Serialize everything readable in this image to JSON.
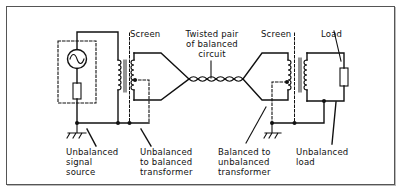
{
  "diagram": {
    "labels": {
      "screen_left": "Screen",
      "screen_right": "Screen",
      "twisted_pair": "Twisted pair\nof balanced\ncircuit",
      "load": "Load",
      "unbalanced_source": "Unbalanced\nsignal\nsource",
      "unbal_to_bal": "Unbalanced\nto balanced\ntransformer",
      "bal_to_unbal": "Balanced to\nunbalanced\ntransformer",
      "unbalanced_load": "Unbalanced\nload"
    },
    "components": [
      {
        "name": "ac-signal-generator",
        "symbol": "sine-source"
      },
      {
        "name": "source-resistor",
        "symbol": "resistor"
      },
      {
        "name": "input-transformer",
        "symbol": "transformer"
      },
      {
        "name": "twisted-pair-cable",
        "symbol": "twisted-pair"
      },
      {
        "name": "output-transformer",
        "symbol": "transformer"
      },
      {
        "name": "load-resistor",
        "symbol": "resistor"
      },
      {
        "name": "ground-left",
        "symbol": "earth"
      },
      {
        "name": "ground-right",
        "symbol": "earth"
      }
    ],
    "colors": {
      "line": "#111111",
      "frame": "#555555",
      "background": "#ffffff"
    }
  }
}
